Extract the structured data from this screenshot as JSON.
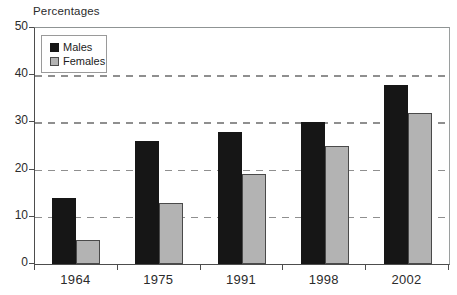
{
  "chart_data": {
    "type": "bar",
    "title": "",
    "xlabel": "",
    "ylabel": "Percentages",
    "categories": [
      "1964",
      "1975",
      "1991",
      "1998",
      "2002"
    ],
    "series": [
      {
        "name": "Males",
        "color": "#161616",
        "values": [
          14,
          26,
          28,
          30,
          38
        ]
      },
      {
        "name": "Females",
        "color": "#b3b3b3",
        "border_color": "#4a4a4a",
        "values": [
          5,
          13,
          19,
          25,
          32
        ]
      }
    ],
    "ylim": [
      0,
      50
    ],
    "yticks": [
      0,
      10,
      20,
      30,
      40,
      50
    ],
    "grid": "dashed-horizontal",
    "legend_position": "top-left-inside",
    "colors": {
      "axis": "#4d4d4d",
      "border": "#9a9e9e",
      "grid": "#8f8f8f",
      "text": "#2b2b2b",
      "background": "#ffffff"
    }
  }
}
